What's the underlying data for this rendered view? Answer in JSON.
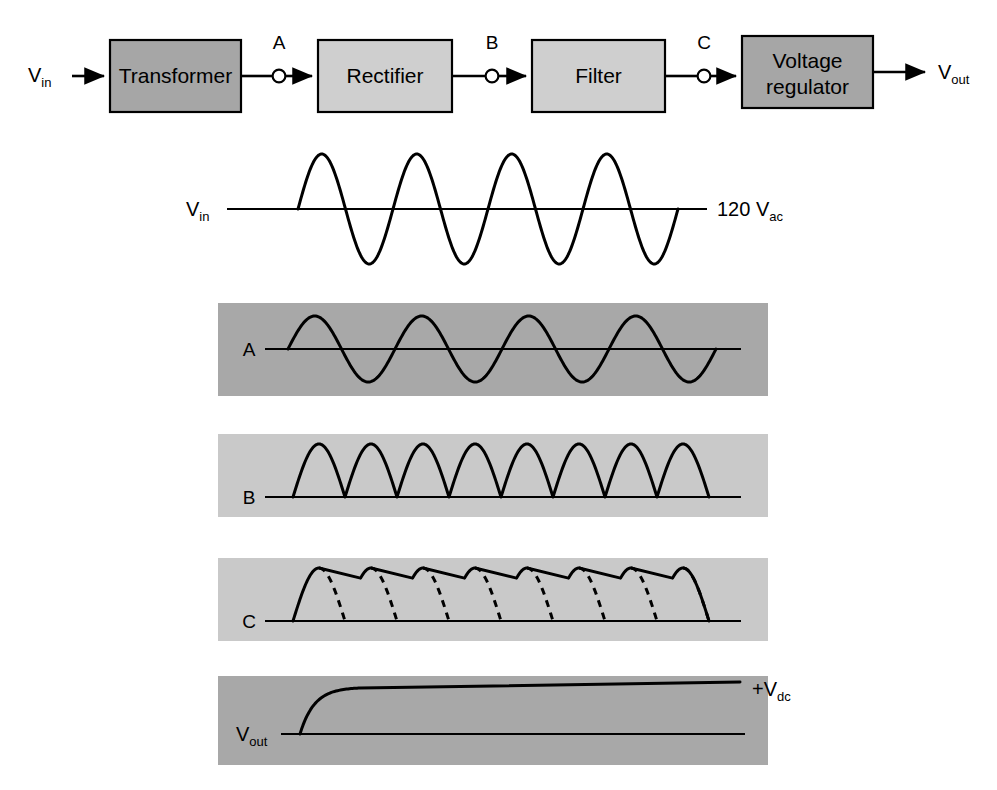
{
  "figure": {
    "background": "#ffffff"
  },
  "colors": {
    "line": "#000000",
    "block_dark": "#a6a6a6",
    "block_light": "#cfcfcf",
    "panel_dark": "#a8a8a8",
    "panel_light": "#c9c9c9"
  },
  "block_diagram": {
    "input_label": "V",
    "input_sub": "in",
    "output_label": "V",
    "output_sub": "out",
    "blocks": [
      {
        "id": "transformer",
        "label": "Transformer",
        "fill": "#a6a6a6",
        "x": 110,
        "y": 40,
        "w": 131,
        "h": 72
      },
      {
        "id": "rectifier",
        "label": "Rectifier",
        "fill": "#cfcfcf",
        "x": 318,
        "y": 40,
        "w": 134,
        "h": 72
      },
      {
        "id": "filter",
        "label": "Filter",
        "fill": "#cfcfcf",
        "x": 532,
        "y": 40,
        "w": 133,
        "h": 72
      },
      {
        "id": "voltage-regulator",
        "label_line1": "Voltage",
        "label_line2": "regulator",
        "fill": "#a6a6a6",
        "x": 742,
        "y": 36,
        "w": 131,
        "h": 72
      }
    ],
    "nodes": [
      {
        "id": "A",
        "label": "A",
        "x": 279,
        "y": 76
      },
      {
        "id": "B",
        "label": "B",
        "x": 492,
        "y": 76
      },
      {
        "id": "C",
        "label": "C",
        "x": 704,
        "y": 76
      }
    ]
  },
  "waveforms": [
    {
      "id": "vin",
      "tag": "V",
      "tag_sub": "in",
      "annotation": "120 V",
      "annotation_sub": "ac",
      "type": "sine",
      "cycles": 4,
      "background": "none",
      "description": "120 V ac sinusoidal line input"
    },
    {
      "id": "panel-a",
      "tag": "A",
      "tag_sub": "",
      "annotation": "",
      "annotation_sub": "",
      "type": "sine",
      "cycles": 4,
      "background": "#a8a8a8",
      "description": "Stepped-down secondary sine wave"
    },
    {
      "id": "panel-b",
      "tag": "B",
      "tag_sub": "",
      "annotation": "",
      "annotation_sub": "",
      "type": "full-wave-rectified",
      "humps": 8,
      "background": "#c9c9c9",
      "description": "Full-wave rectified pulsating dc"
    },
    {
      "id": "panel-c",
      "tag": "C",
      "tag_sub": "",
      "annotation": "",
      "annotation_sub": "",
      "type": "filtered-ripple",
      "humps": 8,
      "background": "#c9c9c9",
      "description": "Filtered dc with ripple; dashed curves show unfiltered rectified wave"
    },
    {
      "id": "panel-vout",
      "tag": "V",
      "tag_sub": "out",
      "annotation": "+V",
      "annotation_sub": "dc",
      "type": "regulated-dc",
      "background": "#a8a8a8",
      "description": "Regulated constant dc output"
    }
  ]
}
